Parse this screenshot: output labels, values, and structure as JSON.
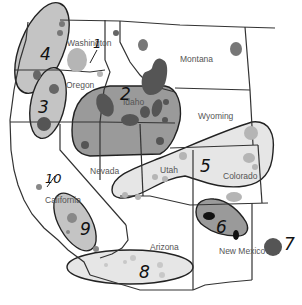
{
  "map": {
    "title": "Western United States regions",
    "colors": {
      "background": "#ffffff",
      "border": "#333333",
      "region_dark": "#9a9a9a",
      "region_medium": "#c4c4c4",
      "region_light": "#e6e6e6",
      "spot_dark": "#555555",
      "spot_medium": "#8a8a8a",
      "spot_light": "#b5b5b5",
      "spot_black": "#111111"
    },
    "states": [
      {
        "name": "Washington"
      },
      {
        "name": "Oregon"
      },
      {
        "name": "Idaho"
      },
      {
        "name": "Montana"
      },
      {
        "name": "Wyoming"
      },
      {
        "name": "Nevada"
      },
      {
        "name": "Utah"
      },
      {
        "name": "Colorado"
      },
      {
        "name": "California"
      },
      {
        "name": "Arizona"
      },
      {
        "name": "New Mexico"
      }
    ],
    "regions": [
      {
        "number": "1"
      },
      {
        "number": "2"
      },
      {
        "number": "3"
      },
      {
        "number": "4"
      },
      {
        "number": "5"
      },
      {
        "number": "6"
      },
      {
        "number": "7"
      },
      {
        "number": "8"
      },
      {
        "number": "9"
      },
      {
        "number": "10"
      }
    ]
  }
}
